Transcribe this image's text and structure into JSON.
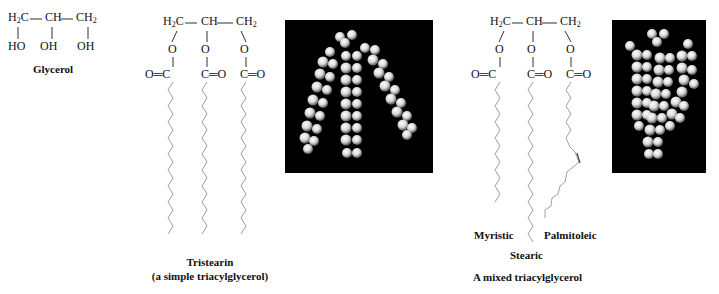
{
  "figure": {
    "glycerol": {
      "backbone": [
        "H2C",
        "CH",
        "CH2"
      ],
      "hydroxyls": [
        "HO",
        "OH",
        "OH"
      ],
      "caption": "Glycerol"
    },
    "tristearin": {
      "backbone": [
        "H2C",
        "CH",
        "CH2"
      ],
      "ester_oxygens": [
        "O",
        "O",
        "O"
      ],
      "carbonyls": [
        "O=C",
        "C=O",
        "C=O"
      ],
      "chains": [
        {
          "name": "Stearic",
          "carbons": 18,
          "double_bond": false
        },
        {
          "name": "Stearic",
          "carbons": 18,
          "double_bond": false
        },
        {
          "name": "Stearic",
          "carbons": 18,
          "double_bond": false
        }
      ],
      "caption_title": "Tristearin",
      "caption_subtitle": "(a simple triacylglycerol)",
      "model": "space-filling-model"
    },
    "mixed": {
      "backbone": [
        "H2C",
        "CH",
        "CH2"
      ],
      "ester_oxygens": [
        "O",
        "O",
        "O"
      ],
      "carbonyls": [
        "O=C",
        "C=O",
        "C=O"
      ],
      "chains": [
        {
          "name": "Myristic",
          "carbons": 14,
          "double_bond": false
        },
        {
          "name": "Stearic",
          "carbons": 18,
          "double_bond": false
        },
        {
          "name": "Palmitoleic",
          "carbons": 16,
          "double_bond": true
        }
      ],
      "chain_labels": {
        "left": "Myristic",
        "middle": "Stearic",
        "right": "Palmitoleic"
      },
      "caption": "A mixed triacylglycerol",
      "model": "space-filling-model"
    }
  },
  "colors": {
    "text": "#111111",
    "bond": "#9a9a9a",
    "model_background": "#000000",
    "atom": "#e6e6e6"
  }
}
